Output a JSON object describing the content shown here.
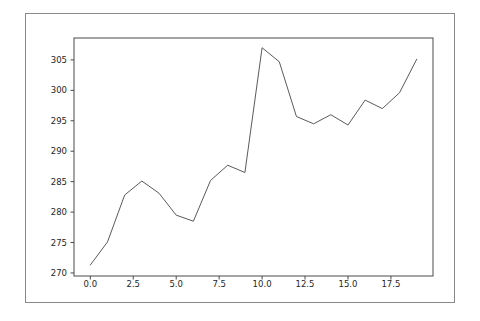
{
  "figure": {
    "background": "#ffffff",
    "frame_color": "#8a8a8a"
  },
  "chart_data": {
    "type": "line",
    "title": "",
    "xlabel": "",
    "ylabel": "",
    "grid": false,
    "legend": null,
    "x": [
      0,
      1,
      2,
      3,
      4,
      5,
      6,
      7,
      8,
      9,
      10,
      11,
      12,
      13,
      14,
      15,
      16,
      17,
      18,
      19
    ],
    "y": [
      271.3,
      275.1,
      282.8,
      285.1,
      283.1,
      279.5,
      278.5,
      285.2,
      287.7,
      286.5,
      307.0,
      304.7,
      295.7,
      294.5,
      296.0,
      294.3,
      298.4,
      297.0,
      299.6,
      305.1
    ],
    "xlim": [
      -0.95,
      19.95
    ],
    "ylim": [
      269.5,
      308.6
    ],
    "xticks": {
      "values": [
        0,
        2.5,
        5,
        7.5,
        10,
        12.5,
        15,
        17.5
      ],
      "labels": [
        "0.0",
        "2.5",
        "5.0",
        "7.5",
        "10.0",
        "12.5",
        "15.0",
        "17.5"
      ]
    },
    "yticks": {
      "values": [
        270,
        275,
        280,
        285,
        290,
        295,
        300,
        305
      ],
      "labels": [
        "270",
        "275",
        "280",
        "285",
        "290",
        "295",
        "300",
        "305"
      ]
    },
    "line_color": "#5a5a5a",
    "line_width": 1,
    "spine_color": "#4a4a4a",
    "tick_color": "#4a4a4a",
    "tick_label_color": "#262626",
    "plot_background": "#ffffff"
  }
}
